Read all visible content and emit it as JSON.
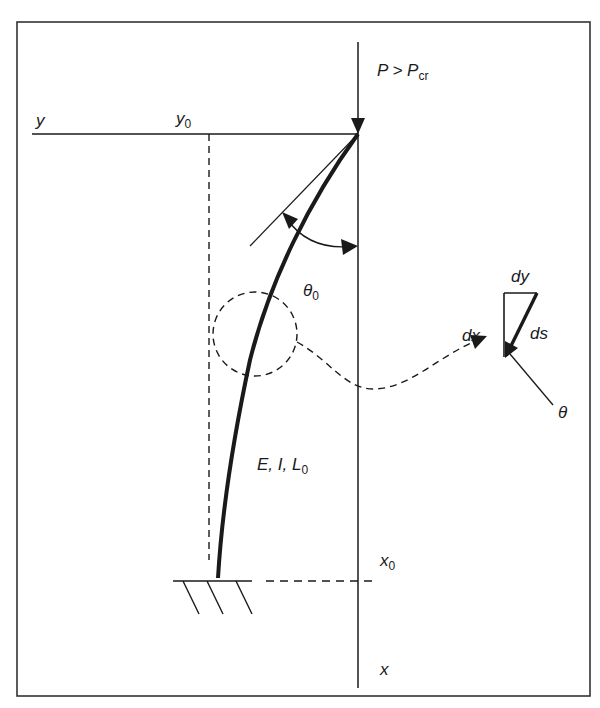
{
  "figure": {
    "type": "buckled-column-diagram",
    "labels": {
      "load": "P > P",
      "load_sub": "cr",
      "y_axis": "y",
      "y0": "y",
      "y0_sub": "0",
      "theta0": "θ",
      "theta0_sub": "0",
      "dx": "dx",
      "dy": "dy",
      "ds": "ds",
      "theta": "θ",
      "properties": "E, I, L",
      "properties_sub": "0",
      "x0": "x",
      "x0_sub": "0",
      "x_axis": "x"
    },
    "colors": {
      "line": "#1a1a1a",
      "frame": "#333333",
      "background": "#ffffff"
    }
  }
}
